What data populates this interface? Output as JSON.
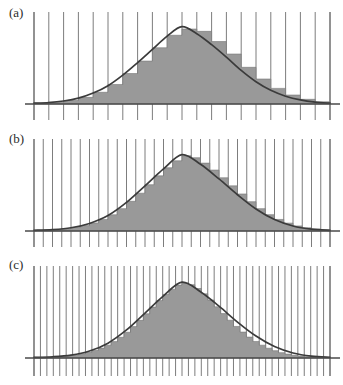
{
  "figure": {
    "title": "",
    "background_color": "#ffffff",
    "width": 343,
    "height": 385,
    "panel_count": 3
  },
  "style": {
    "bar_fill": "#999999",
    "bar_edge": "#777777",
    "curve_color": "#3b3b3b",
    "gridline_color": "#6e6e6e",
    "axis_color": "#4a4a4a",
    "label_color": "#2b2b2b"
  },
  "panels": [
    {
      "id": "a",
      "label": "(a)",
      "bins": 20,
      "description": "coarse histogram with wide bars approximating a normal density curve"
    },
    {
      "id": "b",
      "label": "(b)",
      "bins": 32,
      "description": "medium histogram with narrower bars approximating a normal density curve"
    },
    {
      "id": "c",
      "label": "(c)",
      "bins": 46,
      "description": "fine histogram with very narrow bars closely approximating a normal density curve"
    }
  ],
  "chart_data": [
    {
      "type": "bar",
      "id": "a",
      "title": "(a)",
      "xlabel": "",
      "ylabel": "",
      "grid": true,
      "legend": "none",
      "xlim": [
        -4.0,
        4.0
      ],
      "ylim": [
        0,
        1.05
      ],
      "bin_width": 0.4,
      "categories": [
        "-4.0",
        "-3.6",
        "-3.2",
        "-2.8",
        "-2.4",
        "-2.0",
        "-1.6",
        "-1.2",
        "-0.8",
        "-0.4",
        "0.0",
        "0.4",
        "0.8",
        "1.2",
        "1.6",
        "2.0",
        "2.4",
        "2.8",
        "3.2",
        "3.6"
      ],
      "values": [
        0.012,
        0.022,
        0.045,
        0.085,
        0.15,
        0.25,
        0.39,
        0.55,
        0.72,
        0.88,
        0.96,
        0.93,
        0.8,
        0.64,
        0.47,
        0.32,
        0.2,
        0.115,
        0.06,
        0.028
      ],
      "curve": {
        "name": "normal density",
        "x": [
          -4.0,
          -3.6,
          -3.2,
          -2.8,
          -2.4,
          -2.0,
          -1.6,
          -1.2,
          -0.8,
          -0.4,
          0.0,
          0.4,
          0.8,
          1.2,
          1.6,
          2.0,
          2.4,
          2.8,
          3.2,
          3.6,
          4.0
        ],
        "y": [
          0.01,
          0.018,
          0.038,
          0.075,
          0.14,
          0.235,
          0.37,
          0.53,
          0.7,
          0.87,
          0.99,
          0.9,
          0.76,
          0.6,
          0.43,
          0.285,
          0.175,
          0.1,
          0.052,
          0.024,
          0.01
        ]
      }
    },
    {
      "type": "bar",
      "id": "b",
      "title": "(b)",
      "xlabel": "",
      "ylabel": "",
      "grid": true,
      "legend": "none",
      "xlim": [
        -4.0,
        4.0
      ],
      "ylim": [
        0,
        1.05
      ],
      "bin_width": 0.25,
      "categories": [
        "-4.00",
        "-3.75",
        "-3.50",
        "-3.25",
        "-3.00",
        "-2.75",
        "-2.50",
        "-2.25",
        "-2.00",
        "-1.75",
        "-1.50",
        "-1.25",
        "-1.00",
        "-0.75",
        "-0.50",
        "-0.25",
        "0.00",
        "0.25",
        "0.50",
        "0.75",
        "1.00",
        "1.25",
        "1.50",
        "1.75",
        "2.00",
        "2.25",
        "2.50",
        "2.75",
        "3.00",
        "3.25",
        "3.50",
        "3.75"
      ],
      "values": [
        0.01,
        0.014,
        0.02,
        0.03,
        0.046,
        0.07,
        0.105,
        0.15,
        0.21,
        0.29,
        0.385,
        0.49,
        0.6,
        0.715,
        0.82,
        0.91,
        0.975,
        0.95,
        0.88,
        0.79,
        0.69,
        0.585,
        0.48,
        0.38,
        0.29,
        0.212,
        0.15,
        0.102,
        0.066,
        0.042,
        0.026,
        0.015
      ],
      "curve": {
        "name": "normal density",
        "x": [
          -4.0,
          -3.5,
          -3.0,
          -2.5,
          -2.0,
          -1.5,
          -1.0,
          -0.5,
          0.0,
          0.5,
          1.0,
          1.5,
          2.0,
          2.5,
          3.0,
          3.5,
          4.0
        ],
        "y": [
          0.009,
          0.018,
          0.042,
          0.098,
          0.2,
          0.37,
          0.585,
          0.805,
          0.99,
          0.865,
          0.675,
          0.47,
          0.285,
          0.148,
          0.065,
          0.024,
          0.009
        ]
      }
    },
    {
      "type": "bar",
      "id": "c",
      "title": "(c)",
      "xlabel": "",
      "ylabel": "",
      "grid": true,
      "legend": "none",
      "xlim": [
        -4.0,
        4.0
      ],
      "ylim": [
        0,
        1.05
      ],
      "bin_width": 0.1739,
      "categories": [
        "-4.00",
        "-3.83",
        "-3.65",
        "-3.48",
        "-3.30",
        "-3.13",
        "-2.96",
        "-2.78",
        "-2.61",
        "-2.43",
        "-2.26",
        "-2.09",
        "-1.91",
        "-1.74",
        "-1.57",
        "-1.39",
        "-1.22",
        "-1.04",
        "-0.87",
        "-0.70",
        "-0.52",
        "-0.35",
        "-0.17",
        "0.00",
        "0.17",
        "0.35",
        "0.52",
        "0.70",
        "0.87",
        "1.04",
        "1.22",
        "1.39",
        "1.57",
        "1.74",
        "1.91",
        "2.09",
        "2.26",
        "2.43",
        "2.61",
        "2.78",
        "2.96",
        "3.13",
        "3.30",
        "3.48",
        "3.65",
        "3.83"
      ],
      "values": [
        0.008,
        0.01,
        0.013,
        0.017,
        0.023,
        0.031,
        0.042,
        0.056,
        0.075,
        0.099,
        0.13,
        0.168,
        0.215,
        0.272,
        0.338,
        0.412,
        0.494,
        0.58,
        0.668,
        0.754,
        0.834,
        0.903,
        0.957,
        0.985,
        0.962,
        0.912,
        0.842,
        0.76,
        0.672,
        0.583,
        0.496,
        0.414,
        0.34,
        0.274,
        0.217,
        0.168,
        0.128,
        0.096,
        0.07,
        0.051,
        0.036,
        0.025,
        0.017,
        0.012,
        0.009,
        0.007
      ],
      "curve": {
        "name": "normal density",
        "x": [
          -4.0,
          -3.5,
          -3.0,
          -2.5,
          -2.0,
          -1.5,
          -1.0,
          -0.5,
          0.0,
          0.5,
          1.0,
          1.5,
          2.0,
          2.5,
          3.0,
          3.5,
          4.0
        ],
        "y": [
          0.008,
          0.016,
          0.038,
          0.092,
          0.195,
          0.368,
          0.59,
          0.815,
          0.995,
          0.87,
          0.68,
          0.472,
          0.288,
          0.15,
          0.066,
          0.025,
          0.01
        ]
      }
    }
  ]
}
